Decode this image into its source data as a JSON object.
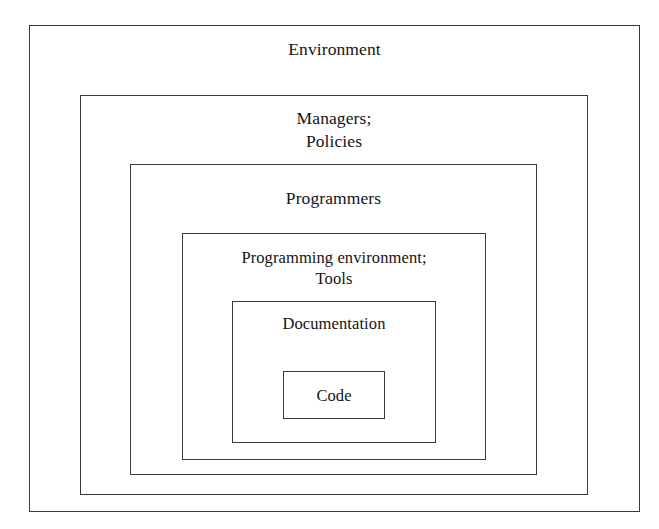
{
  "diagram": {
    "type": "nested-boxes",
    "background_color": "#ffffff",
    "border_color": "#3a3a3a",
    "text_color": "#141414",
    "layers": [
      {
        "id": "environment",
        "depth": 1,
        "label": "Environment",
        "lines": [
          "Environment"
        ],
        "rect": {
          "x": 29,
          "y": 25,
          "width": 611,
          "height": 487
        }
      },
      {
        "id": "managers-policies",
        "depth": 2,
        "label": "Managers;\nPolicies",
        "lines": [
          "Managers;",
          "Policies"
        ],
        "rect": {
          "x": 80,
          "y": 95,
          "width": 508,
          "height": 400
        }
      },
      {
        "id": "programmers",
        "depth": 3,
        "label": "Programmers",
        "lines": [
          "Programmers"
        ],
        "rect": {
          "x": 130,
          "y": 164,
          "width": 407,
          "height": 311
        }
      },
      {
        "id": "programming-environment-tools",
        "depth": 4,
        "label": "Programming environment;\nTools",
        "lines": [
          "Programming environment;",
          "Tools"
        ],
        "rect": {
          "x": 182,
          "y": 233,
          "width": 304,
          "height": 227
        }
      },
      {
        "id": "documentation",
        "depth": 5,
        "label": "Documentation",
        "lines": [
          "Documentation"
        ],
        "rect": {
          "x": 232,
          "y": 301,
          "width": 204,
          "height": 142
        }
      },
      {
        "id": "code",
        "depth": 6,
        "label": "Code",
        "lines": [
          "Code"
        ],
        "rect": {
          "x": 283,
          "y": 371,
          "width": 102,
          "height": 48
        }
      }
    ]
  }
}
